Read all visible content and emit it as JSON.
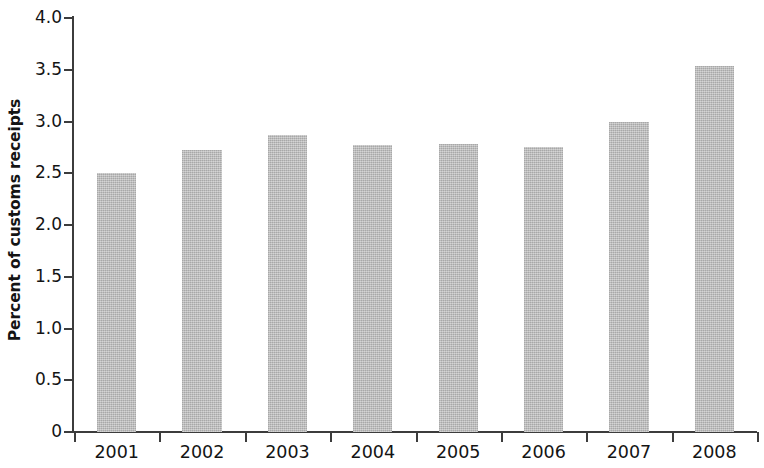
{
  "chart_data": {
    "type": "bar",
    "title": "",
    "subtitle": "",
    "xlabel": "",
    "ylabel": "Percent of customs receipts",
    "categories": [
      "2001",
      "2002",
      "2003",
      "2004",
      "2005",
      "2006",
      "2007",
      "2008"
    ],
    "values": [
      2.5,
      2.72,
      2.87,
      2.77,
      2.78,
      2.75,
      3.0,
      3.54
    ],
    "series": [
      {
        "name": "Percent of customs receipts",
        "values": [
          2.5,
          2.72,
          2.87,
          2.77,
          2.78,
          2.75,
          3.0,
          3.54
        ]
      }
    ],
    "ylim": [
      0,
      4.0
    ],
    "ytick_labels": [
      "4.0",
      "3.5",
      "3.0",
      "2.5",
      "2.0",
      "1.5",
      "1.0",
      "0.5",
      "0"
    ],
    "ytick_values": [
      4.0,
      3.5,
      3.0,
      2.5,
      2.0,
      1.5,
      1.0,
      0.5,
      0
    ],
    "grid": false,
    "legend": null,
    "legend_position": "none",
    "bar_color": "#bcbcbc",
    "axis_color": "#3c3c3c",
    "text_color": "#141414",
    "background": "#ffffff"
  }
}
